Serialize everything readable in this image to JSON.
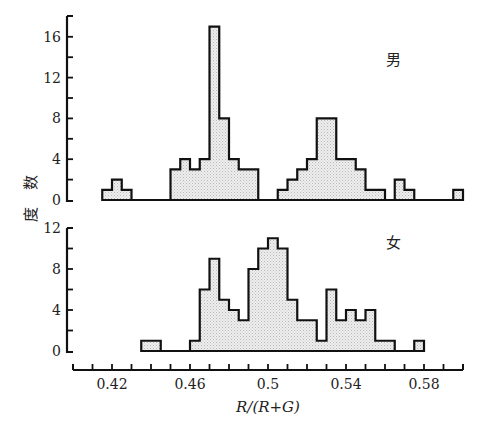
{
  "chart_data": [
    {
      "type": "bar",
      "subtype": "histogram",
      "panel": "top",
      "title": "男",
      "xlabel": "R/(R+G)",
      "ylabel": "度数",
      "bin_width": 0.005,
      "xlim": [
        0.4,
        0.6
      ],
      "ylim": [
        0,
        18
      ],
      "yticks": [
        0,
        4,
        8,
        12,
        16
      ],
      "ytick_labels": [
        "0",
        "4",
        "8",
        "12",
        "16"
      ],
      "bins": [
        {
          "x": 0.415,
          "count": 1
        },
        {
          "x": 0.42,
          "count": 2
        },
        {
          "x": 0.425,
          "count": 1
        },
        {
          "x": 0.45,
          "count": 3
        },
        {
          "x": 0.455,
          "count": 4
        },
        {
          "x": 0.46,
          "count": 3
        },
        {
          "x": 0.465,
          "count": 4
        },
        {
          "x": 0.47,
          "count": 17
        },
        {
          "x": 0.475,
          "count": 8
        },
        {
          "x": 0.48,
          "count": 4
        },
        {
          "x": 0.485,
          "count": 3
        },
        {
          "x": 0.49,
          "count": 3
        },
        {
          "x": 0.505,
          "count": 1
        },
        {
          "x": 0.51,
          "count": 2
        },
        {
          "x": 0.515,
          "count": 3
        },
        {
          "x": 0.52,
          "count": 4
        },
        {
          "x": 0.525,
          "count": 8
        },
        {
          "x": 0.53,
          "count": 8
        },
        {
          "x": 0.535,
          "count": 4
        },
        {
          "x": 0.54,
          "count": 4
        },
        {
          "x": 0.545,
          "count": 3
        },
        {
          "x": 0.55,
          "count": 1
        },
        {
          "x": 0.555,
          "count": 1
        },
        {
          "x": 0.565,
          "count": 2
        },
        {
          "x": 0.57,
          "count": 1
        },
        {
          "x": 0.595,
          "count": 1
        }
      ],
      "grid": false
    },
    {
      "type": "bar",
      "subtype": "histogram",
      "panel": "bottom",
      "title": "女",
      "xlabel": "R/(R+G)",
      "ylabel": "度数",
      "bin_width": 0.005,
      "xlim": [
        0.4,
        0.6
      ],
      "ylim": [
        0,
        12
      ],
      "yticks": [
        0,
        4,
        8,
        12
      ],
      "ytick_labels": [
        "0",
        "4",
        "8",
        "12"
      ],
      "xticks": [
        0.42,
        0.46,
        0.5,
        0.54,
        0.58
      ],
      "xtick_labels": [
        "0.42",
        "0.46",
        "0.5",
        "0.54",
        "0.58"
      ],
      "bins": [
        {
          "x": 0.435,
          "count": 1
        },
        {
          "x": 0.44,
          "count": 1
        },
        {
          "x": 0.46,
          "count": 1
        },
        {
          "x": 0.465,
          "count": 6
        },
        {
          "x": 0.47,
          "count": 9
        },
        {
          "x": 0.475,
          "count": 5
        },
        {
          "x": 0.48,
          "count": 4
        },
        {
          "x": 0.485,
          "count": 3
        },
        {
          "x": 0.49,
          "count": 8
        },
        {
          "x": 0.495,
          "count": 10
        },
        {
          "x": 0.5,
          "count": 11
        },
        {
          "x": 0.505,
          "count": 10
        },
        {
          "x": 0.51,
          "count": 5
        },
        {
          "x": 0.515,
          "count": 3
        },
        {
          "x": 0.52,
          "count": 3
        },
        {
          "x": 0.525,
          "count": 1
        },
        {
          "x": 0.53,
          "count": 6
        },
        {
          "x": 0.535,
          "count": 3
        },
        {
          "x": 0.54,
          "count": 4
        },
        {
          "x": 0.545,
          "count": 3
        },
        {
          "x": 0.55,
          "count": 4
        },
        {
          "x": 0.555,
          "count": 1
        },
        {
          "x": 0.56,
          "count": 1
        },
        {
          "x": 0.575,
          "count": 1
        }
      ],
      "grid": false
    }
  ],
  "labels": {
    "ylabel": "度数",
    "xlabel": "R/(R+G)",
    "male": "男",
    "female": "女"
  },
  "colors": {
    "fill": "#e4e4e4",
    "stroke": "#111111"
  }
}
